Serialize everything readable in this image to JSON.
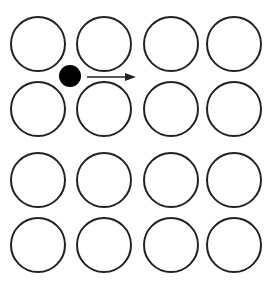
{
  "diagram": {
    "colors": {
      "background": "#ffffff",
      "stroke": "#222222",
      "particle": "#000000"
    },
    "lattice": {
      "rows": 4,
      "cols": 4,
      "col_x": [
        38,
        104,
        171,
        234
      ],
      "row_y": [
        44,
        109,
        180,
        245
      ],
      "radius": 27
    },
    "particle": {
      "cx": 70,
      "cy": 76,
      "r": 11
    },
    "arrow": {
      "x1": 87,
      "y1": 77,
      "x2": 136,
      "y2": 77
    }
  }
}
